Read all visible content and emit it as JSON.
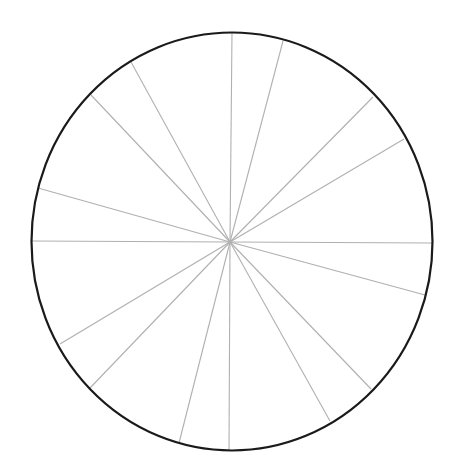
{
  "diagram": {
    "type": "circle-divided-into-sectors",
    "sector_count": 16,
    "colors": {
      "background": "#ffffff",
      "outline": "#1a1a1a",
      "spokes": "#b0b0b0"
    },
    "outline": {
      "cx": 232,
      "cy": 241.5,
      "rx": 200.5,
      "ry": 209,
      "stroke_width": 2.2
    },
    "hub": {
      "x": 230,
      "y": 242
    },
    "spokes": [
      {
        "x": 232,
        "y": 32
      },
      {
        "x": 283,
        "y": 41
      },
      {
        "x": 373,
        "y": 97
      },
      {
        "x": 404,
        "y": 139
      },
      {
        "x": 432,
        "y": 243
      },
      {
        "x": 425,
        "y": 295
      },
      {
        "x": 371,
        "y": 389
      },
      {
        "x": 330,
        "y": 421
      },
      {
        "x": 229,
        "y": 451
      },
      {
        "x": 179,
        "y": 443
      },
      {
        "x": 90,
        "y": 388
      },
      {
        "x": 60,
        "y": 344
      },
      {
        "x": 31,
        "y": 241
      },
      {
        "x": 38,
        "y": 188
      },
      {
        "x": 91,
        "y": 95
      },
      {
        "x": 131,
        "y": 62
      }
    ]
  }
}
